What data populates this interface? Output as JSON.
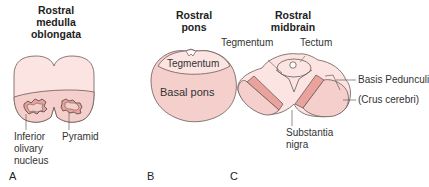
{
  "panels": [
    {
      "letter": "A",
      "title_line1": "Rostral medulla",
      "title_line2": "oblongata",
      "labels": {
        "inferior_olivary_1": "Inferior",
        "inferior_olivary_2": "olivary",
        "inferior_olivary_3": "nucleus",
        "pyramid": "Pyramid"
      }
    },
    {
      "letter": "B",
      "title_line1": "Rostral",
      "title_line2": "pons",
      "labels": {
        "tegmentum": "Tegmentum",
        "basal_pons": "Basal pons"
      }
    },
    {
      "letter": "C",
      "title_line1": "Rostral",
      "title_line2": "midbrain",
      "labels": {
        "tegmentum": "Tegmentum",
        "tectum": "Tectum",
        "basis_pedunculi": "Basis Pedunculi",
        "crus_cerebri": "(Crus cerebri)",
        "substantia_nigra_1": "Substantia",
        "substantia_nigra_2": "nigra"
      }
    }
  ],
  "colors": {
    "light_fill": "#fbe4e1",
    "mid_fill": "#f5cfcb",
    "dark_fill": "#eaa39c",
    "outline": "#6b5a58",
    "text": "#333333"
  }
}
